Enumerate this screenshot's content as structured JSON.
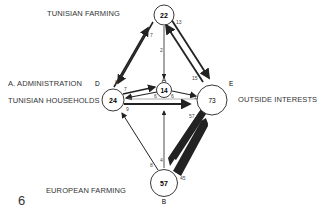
{
  "figure_number": "6",
  "nodes": {
    "A": {
      "letter": "A",
      "value": "14",
      "label": "A. ADMINISTRATION"
    },
    "B": {
      "letter": "B",
      "value": "57",
      "label": "EUROPEAN FARMING"
    },
    "C": {
      "letter": "C",
      "value": "22",
      "label": "TUNISIAN FARMING"
    },
    "D": {
      "letter": "D",
      "value": "24",
      "label": "TUNISIAN HOUSEHOLDS"
    },
    "E": {
      "letter": "E",
      "value": "73",
      "label": "OUTSIDE INTERESTS"
    }
  },
  "flows": [
    {
      "from": "C",
      "to": "D",
      "value": "7"
    },
    {
      "from": "D",
      "to": "C",
      "value": "8"
    },
    {
      "from": "C",
      "to": "A",
      "value": "2"
    },
    {
      "from": "C",
      "to": "E",
      "value": "13"
    },
    {
      "from": "E",
      "to": "C",
      "value": "15"
    },
    {
      "from": "D",
      "to": "A",
      "value": "7"
    },
    {
      "from": "A",
      "to": "D",
      "value": "6"
    },
    {
      "from": "A",
      "to": "E",
      "value": "6"
    },
    {
      "from": "E",
      "to": "D",
      "value": "1"
    },
    {
      "from": "D",
      "to": "E",
      "value": "9"
    },
    {
      "from": "B",
      "to": "D",
      "value": "8"
    },
    {
      "from": "B",
      "to": "A",
      "value": "4"
    },
    {
      "from": "E",
      "to": "B",
      "value": "57"
    },
    {
      "from": "B",
      "to": "E",
      "value": "45"
    }
  ]
}
